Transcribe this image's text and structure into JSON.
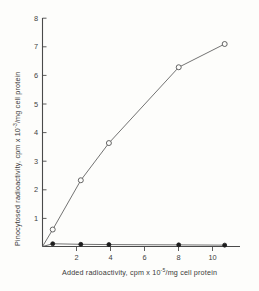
{
  "chart_data": {
    "type": "line",
    "title": "",
    "xlabel": "Added radioactivity, cpm x 10",
    "xlabel_exponent": "-5",
    "xlabel_tail": "/mg cell protein",
    "ylabel": "Pinocytosed radioactivity, cpm x 10",
    "ylabel_exponent": "-3",
    "ylabel_tail": "/mg cell protein",
    "xlim": [
      0,
      11.6
    ],
    "ylim": [
      0,
      8.35
    ],
    "xticks": [
      2,
      4,
      6,
      8,
      10
    ],
    "xtick_labels": [
      "2",
      "4",
      "6",
      "8",
      "10"
    ],
    "yticks": [
      1,
      2,
      3,
      4,
      5,
      6,
      7,
      8
    ],
    "ytick_labels": [
      "1",
      "2",
      "3",
      "4",
      "5",
      "6",
      "7",
      "8"
    ],
    "grid": false,
    "legend": "none",
    "series": [
      {
        "name": "pinocytosed-open",
        "marker": "open-circle",
        "x": [
          0,
          0.6,
          2.25,
          3.9,
          8.0,
          10.7
        ],
        "y": [
          0,
          0.62,
          2.42,
          3.78,
          6.55,
          7.4
        ]
      },
      {
        "name": "control-filled",
        "marker": "filled-circle",
        "x": [
          0,
          0.6,
          2.25,
          3.9,
          8.0,
          10.7
        ],
        "y": [
          0,
          0.1,
          0.08,
          0.07,
          0.06,
          0.05
        ]
      }
    ],
    "colors": {
      "axis": "#4a4a4a",
      "curve": "#5a5a5a",
      "open_marker_fill": "#fdfdfb",
      "filled_marker": "#1d1d1d",
      "background": "#fdfdfb"
    }
  }
}
